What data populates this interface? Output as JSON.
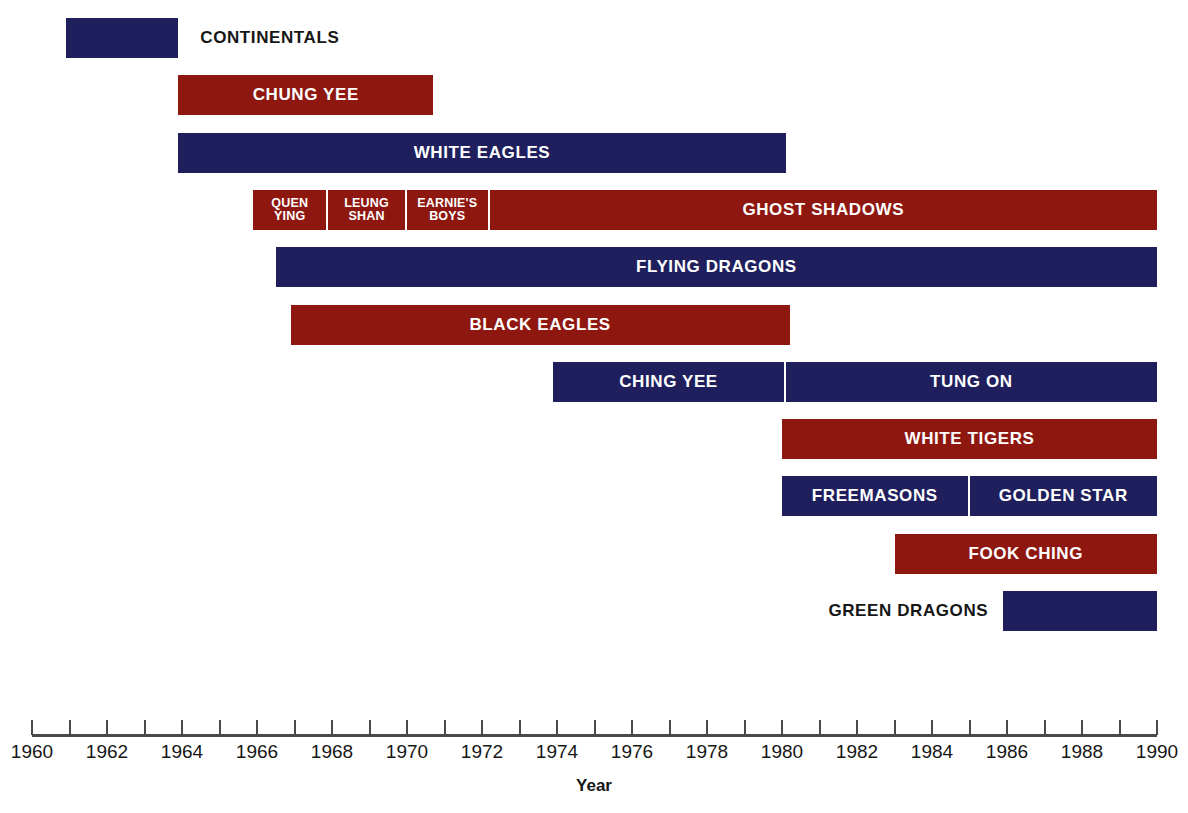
{
  "chart_data": {
    "type": "table",
    "title": "",
    "subtitle": "",
    "xlabel": "Year",
    "ylabel": "",
    "xlim": [
      1960,
      1990
    ],
    "x_tick_step": 2,
    "x_minor_tick_step": 1,
    "grid": false,
    "legend": "none",
    "colors": {
      "blue": "#1f1f5e",
      "red": "#8e1710",
      "axis": "#4a4a4a",
      "text_dark": "#161616",
      "text_light": "#ffffff",
      "background": "#ffffff"
    },
    "categories": [
      "CONTINENTALS",
      "CHUNG YEE",
      "WHITE EAGLES",
      "QUEN YING",
      "LEUNG SHAN",
      "EARNIE'S BOYS",
      "GHOST SHADOWS",
      "FLYING DRAGONS",
      "BLACK EAGLES",
      "CHING YEE",
      "TUNG ON",
      "WHITE TIGERS",
      "FREEMASONS",
      "GOLDEN STAR",
      "FOOK CHING",
      "GREEN DRAGONS"
    ],
    "x_tick_labels": [
      "1960",
      "1962",
      "1964",
      "1966",
      "1968",
      "1970",
      "1972",
      "1974",
      "1976",
      "1978",
      "1980",
      "1982",
      "1984",
      "1986",
      "1988",
      "1990"
    ],
    "x_tick_values": [
      1960,
      1962,
      1964,
      1966,
      1968,
      1970,
      1972,
      1974,
      1976,
      1978,
      1980,
      1982,
      1984,
      1986,
      1988,
      1990
    ],
    "rows": [
      {
        "row": 0,
        "bars": [
          {
            "label": "CONTINENTALS",
            "start": 1960.9,
            "end": 1963.9,
            "color": "blue",
            "label_position": "right",
            "label_size": "normal"
          }
        ]
      },
      {
        "row": 1,
        "bars": [
          {
            "label": "CHUNG YEE",
            "start": 1963.9,
            "end": 1970.7,
            "color": "red",
            "label_position": "inside",
            "label_size": "normal"
          }
        ]
      },
      {
        "row": 2,
        "bars": [
          {
            "label": "WHITE EAGLES",
            "start": 1963.9,
            "end": 1980.1,
            "color": "blue",
            "label_position": "inside",
            "label_size": "normal"
          }
        ]
      },
      {
        "row": 3,
        "bars": [
          {
            "label": "QUEN\nYING",
            "start": 1965.9,
            "end": 1967.9,
            "color": "red",
            "label_position": "inside",
            "label_size": "small",
            "split_left": true
          },
          {
            "label": "LEUNG\nSHAN",
            "start": 1967.9,
            "end": 1970.0,
            "color": "red",
            "label_position": "inside",
            "label_size": "small",
            "split_left": true
          },
          {
            "label": "EARNIE'S\nBOYS",
            "start": 1970.0,
            "end": 1972.2,
            "color": "red",
            "label_position": "inside",
            "label_size": "small",
            "split_left": true
          },
          {
            "label": "GHOST SHADOWS",
            "start": 1972.2,
            "end": 1990.0,
            "color": "red",
            "label_position": "inside",
            "label_size": "normal"
          }
        ]
      },
      {
        "row": 4,
        "bars": [
          {
            "label": "FLYING DRAGONS",
            "start": 1966.5,
            "end": 1990.0,
            "color": "blue",
            "label_position": "inside",
            "label_size": "normal"
          }
        ]
      },
      {
        "row": 5,
        "bars": [
          {
            "label": "BLACK EAGLES",
            "start": 1966.9,
            "end": 1980.2,
            "color": "red",
            "label_position": "inside",
            "label_size": "normal"
          }
        ]
      },
      {
        "row": 6,
        "bars": [
          {
            "label": "CHING YEE",
            "start": 1973.9,
            "end": 1980.1,
            "color": "blue",
            "label_position": "inside",
            "label_size": "normal",
            "split_left": true
          },
          {
            "label": "TUNG ON",
            "start": 1980.1,
            "end": 1990.0,
            "color": "blue",
            "label_position": "inside",
            "label_size": "normal"
          }
        ]
      },
      {
        "row": 7,
        "bars": [
          {
            "label": "WHITE TIGERS",
            "start": 1980.0,
            "end": 1990.0,
            "color": "red",
            "label_position": "inside",
            "label_size": "normal"
          }
        ]
      },
      {
        "row": 8,
        "bars": [
          {
            "label": "FREEMASONS",
            "start": 1980.0,
            "end": 1985.0,
            "color": "blue",
            "label_position": "inside",
            "label_size": "normal",
            "split_left": true
          },
          {
            "label": "GOLDEN STAR",
            "start": 1985.0,
            "end": 1990.0,
            "color": "blue",
            "label_position": "inside",
            "label_size": "normal"
          }
        ]
      },
      {
        "row": 9,
        "bars": [
          {
            "label": "FOOK CHING",
            "start": 1983.0,
            "end": 1990.0,
            "color": "red",
            "label_position": "inside",
            "label_size": "normal"
          }
        ]
      },
      {
        "row": 10,
        "bars": [
          {
            "label": "GREEN DRAGONS",
            "start": 1985.9,
            "end": 1990.0,
            "color": "blue",
            "label_position": "left",
            "label_size": "normal"
          }
        ]
      }
    ]
  },
  "axis": {
    "title": "Year"
  },
  "layout": {
    "plot_left_px": 32,
    "plot_right_px": 1157,
    "row_top_px": 18,
    "row_height_px": 40,
    "row_pitch_px": 57.3
  }
}
